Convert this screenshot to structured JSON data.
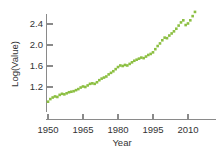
{
  "chart_data": {
    "type": "scatter",
    "title": "",
    "subtitle": "",
    "xlabel": "Year",
    "ylabel": "Log(Value)",
    "xlim": [
      1948,
      2015
    ],
    "ylim": [
      0.82,
      2.72
    ],
    "grid": false,
    "legend": "none",
    "marker": {
      "shape": "square",
      "color": "#8CBF42",
      "size": 2.6
    },
    "xticks": [
      1950,
      1965,
      1980,
      1995,
      2010
    ],
    "xtick_labels": [
      "1950",
      "1965",
      "1980",
      "1995",
      "2010"
    ],
    "yticks": [
      1.2,
      1.6,
      2.0,
      2.4
    ],
    "ytick_labels": [
      "1.2",
      "1.6",
      "2.0",
      "2.4"
    ],
    "series": [
      {
        "name": "Log(Value)",
        "color": "#8CBF42",
        "x": [
          1950,
          1951,
          1952,
          1953,
          1954,
          1955,
          1956,
          1957,
          1958,
          1959,
          1960,
          1961,
          1962,
          1963,
          1964,
          1965,
          1966,
          1967,
          1968,
          1969,
          1970,
          1971,
          1972,
          1973,
          1974,
          1975,
          1976,
          1977,
          1978,
          1979,
          1980,
          1981,
          1982,
          1983,
          1984,
          1985,
          1986,
          1987,
          1988,
          1989,
          1990,
          1991,
          1992,
          1993,
          1994,
          1995,
          1996,
          1997,
          1998,
          1999,
          2000,
          2001,
          2002,
          2003,
          2004,
          2005,
          2006,
          2007,
          2008,
          2009,
          2010,
          2011,
          2012,
          2013
        ],
        "y": [
          0.92,
          0.97,
          1.0,
          1.02,
          1.01,
          1.05,
          1.07,
          1.06,
          1.08,
          1.1,
          1.11,
          1.12,
          1.14,
          1.16,
          1.19,
          1.21,
          1.2,
          1.23,
          1.26,
          1.27,
          1.26,
          1.29,
          1.33,
          1.36,
          1.38,
          1.4,
          1.44,
          1.47,
          1.5,
          1.54,
          1.58,
          1.61,
          1.6,
          1.62,
          1.61,
          1.64,
          1.67,
          1.7,
          1.72,
          1.74,
          1.76,
          1.75,
          1.78,
          1.81,
          1.83,
          1.86,
          1.92,
          1.98,
          2.03,
          2.09,
          2.14,
          2.13,
          2.18,
          2.22,
          2.26,
          2.31,
          2.37,
          2.43,
          2.47,
          2.38,
          2.41,
          2.47,
          2.55,
          2.63
        ]
      }
    ]
  }
}
